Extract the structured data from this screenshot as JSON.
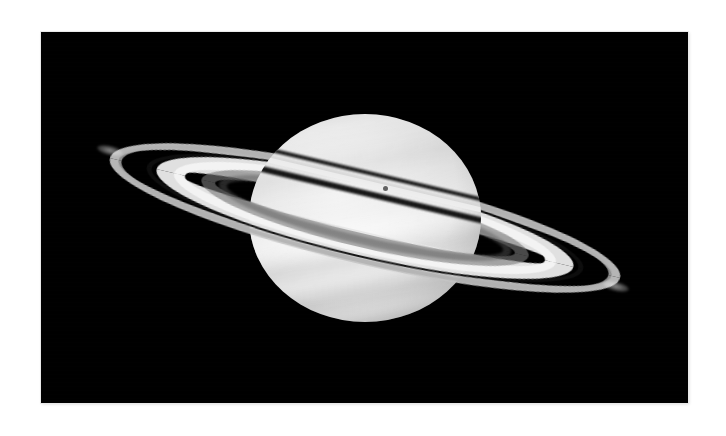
{
  "image": {
    "subject": "saturn",
    "description": "Grayscale telescope photograph of the planet Saturn with its ring system tilted, shown against a black sky",
    "palette": {
      "page_background": "#ffffff",
      "sky_background": "#000000",
      "planet_highlight": "#f2f2f2",
      "planet_midtone": "#c2c2c2",
      "planet_limb": "#1b1b1b",
      "ring_b_bright": "#f4f4f4",
      "ring_a_grey": "#c4c4c4",
      "cassini_division": "#0e0e0e",
      "ring_c_faint": "#7a7a7a",
      "moon_spot": "#5b5b5b"
    },
    "frame": {
      "left": 41,
      "top": 32,
      "width": 647,
      "height": 371
    }
  },
  "features": [
    {
      "id": "planet-globe",
      "label": "Saturn globe",
      "note": "Oblate disk with banded cloud structure"
    },
    {
      "id": "ring-a",
      "label": "A ring",
      "note": "Outer grey ring"
    },
    {
      "id": "cassini-division",
      "label": "Cassini Division",
      "note": "Dark gap between A and B rings"
    },
    {
      "id": "ring-b",
      "label": "B ring",
      "note": "Brightest, broadest ring"
    },
    {
      "id": "ring-c",
      "label": "C ring",
      "note": "Faint inner crepe ring"
    },
    {
      "id": "ring-shadow",
      "label": "Ring shadow",
      "note": "Dark lines cast by the rings onto the northern hemisphere"
    },
    {
      "id": "globe-shadow",
      "label": "Planet shadow on rings",
      "note": "Dark wedge where the globe shadows the far ring arc"
    },
    {
      "id": "moon-spot",
      "label": "Moon transit spot",
      "note": "Small dark dot on the upper disk"
    },
    {
      "id": "equatorial-zone",
      "label": "Equatorial bright zone",
      "note": "Broad bright band across the middle of the disk"
    },
    {
      "id": "ring-ansa-left",
      "label": "Left ring ansa",
      "note": "Upper-left ring tip"
    },
    {
      "id": "ring-ansa-right",
      "label": "Right ring ansa",
      "note": "Lower-right ring tip"
    }
  ],
  "geometry": {
    "ring_tilt_degrees": 13.2,
    "planet_center_x": 365,
    "planet_center_y": 218,
    "planet_width": 232,
    "planet_height": 208,
    "ring_major_axis": 524,
    "ring_minor_axis": 92
  }
}
